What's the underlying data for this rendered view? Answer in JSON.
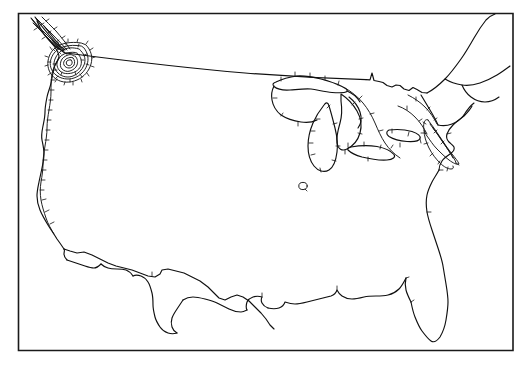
{
  "figure": {
    "type": "contour-map",
    "region": "Contiguous United States",
    "projection": "conic",
    "background_color": "#ffffff",
    "line_color": "#101010",
    "contour_color": "#151515",
    "frame_color": "#1a1a1a",
    "has_labels": false,
    "has_legend": false,
    "has_axes": false,
    "has_title": false
  },
  "frame": {
    "x": 18,
    "y": 13,
    "width": 495,
    "height": 338
  },
  "features": [
    {
      "name": "national-outline",
      "kind": "coastline-and-border",
      "label": ""
    },
    {
      "name": "great-lakes",
      "kind": "lake-outline",
      "label": ""
    },
    {
      "name": "canada-border",
      "kind": "political-border",
      "label": ""
    },
    {
      "name": "mexico-border",
      "kind": "political-border",
      "label": ""
    }
  ],
  "contours": [
    {
      "name": "pacific-northwest-center",
      "kind": "closed-concentric",
      "ring_count": 7,
      "hatched": true,
      "hatch_direction": "outward",
      "center_x": 68,
      "center_y": 58,
      "label": ""
    },
    {
      "name": "west-coast-isoline",
      "kind": "open-line",
      "hatched": true,
      "hatch_direction": "inward",
      "label": ""
    },
    {
      "name": "great-lakes-isoline",
      "kind": "open-line",
      "hatched": true,
      "hatch_direction": "inward",
      "label": ""
    },
    {
      "name": "northeast-isoline",
      "kind": "open-line",
      "hatched": true,
      "hatch_direction": "inward",
      "label": ""
    },
    {
      "name": "central-plains-ring",
      "kind": "small-closed-ring",
      "hatched": false,
      "center_x": 303,
      "center_y": 186,
      "radius": 4,
      "label": ""
    }
  ],
  "paths": {
    "frame_rect": "M18,13 L513,13 L513,351 L18,351 Z",
    "canada_border": "M72,55 C130,62 200,70 262,74 C310,77 340,78 368,79 L372,72 L374,80 L384,82 L392,86 L400,84 L408,90 L414,87 L422,92",
    "west_coast": "M36,20 L40,28 L44,34 L48,40 L52,46 L56,50 L58,56 L54,62 L52,70 L50,76 L48,84 L46,92 L44,100 L42,108 L44,116 L42,124 L40,132 L42,140 L44,148 L42,156 L40,164 L42,172 L40,180 L38,188 L36,196 L38,204 L40,212 L42,220 L46,226 L50,232 L54,238 L58,244 L62,250",
    "mexico_border": "M62,250 L70,252 L76,254 L82,252 L88,254 L96,258 L104,262 L112,266 L120,268 L128,270 L136,272 L144,276 L152,278 L158,276 L162,272 L164,268 L170,268 L178,270 L186,272 L194,276 L202,280 L210,286 L216,292 L220,298 L226,300 L232,296 L238,294 L244,296 L250,300 L256,306 L262,312 L266,318 L270,324 L274,328",
    "gulf_coast": "M274,328 L280,324 L286,318 L290,312 L296,310 L302,312 L306,310 L312,306 L318,304 L324,302 L330,300 L336,298 L342,296 L348,294 L352,296 L356,298 L362,300 L368,298 L374,294 L380,292 L386,294 L392,296 L398,300 L404,304 L408,310",
    "florida": "M408,310 L412,318 L416,326 L420,334 L426,340 L432,344 L438,340 L442,334 L444,326 L446,318 L448,310 L448,302 L446,294 L444,286 L442,278 L440,270 L438,262 L436,254 L434,246 L432,238 L430,230 L428,222 L426,214 L424,206 L424,198 L426,192 L430,188",
    "atlantic_coast": "M430,188 L434,182 L438,176 L440,170 L442,164 L446,158 L450,152 L454,148 L458,144 L462,140 L464,134 L466,128 L470,124 L474,120 L478,116 L482,112 L486,108 L490,104 L494,100 L498,96 L502,92",
    "northeast_border": "M502,92 L498,86 L494,80 L490,74 L486,68 L482,62 L478,56 L474,50 L470,44 L466,38 L462,34 L458,30 L454,26 L450,24",
    "lake_michigan": "M322,108 L318,114 L314,120 L312,128 L310,136 L310,144 L312,152 L316,158 L322,162 L328,160 L332,154 L334,146 L334,138 L332,130 L330,122 L328,114 L326,108 Z",
    "lake_superior": "M282,80 L290,78 L298,76 L306,76 L314,78 L322,80 L330,82 L338,84 L344,88 L340,92 L332,92 L324,90 L316,88 L308,88 L300,90 L292,90 L284,88 L280,84 Z",
    "lake_huron": "M340,96 L346,100 L352,106 L356,114 L356,122 L352,130 L346,136 L340,138 L336,132 L336,124 L338,116 L338,108 L338,100 Z",
    "lake_erie": "M352,142 L362,142 L372,144 L380,148 L384,152 L378,156 L368,156 L358,154 L350,150 L348,146 Z",
    "lake_ontario": "M388,134 L398,134 L406,136 L412,140 L408,144 L398,144 L390,142 L386,138 Z",
    "central_ring": "M300,183 a4,3.5 0 1 0 0.1,0 Z"
  }
}
